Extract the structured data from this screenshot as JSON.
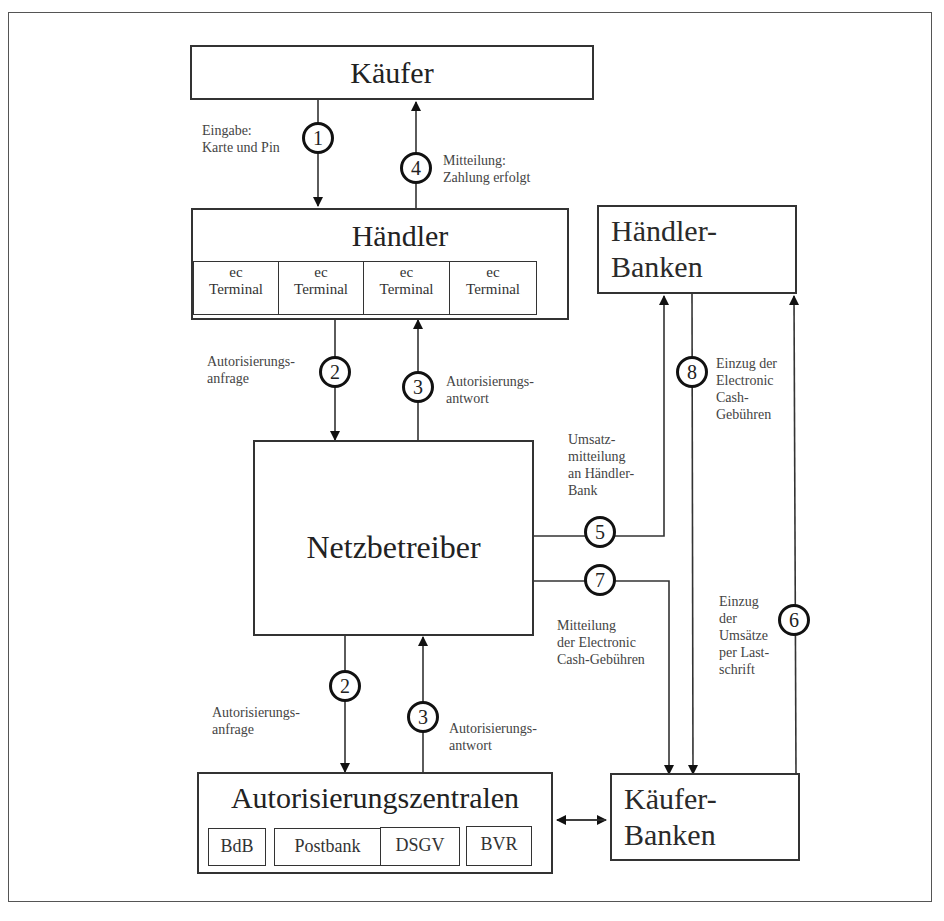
{
  "diagram": {
    "nodes": {
      "kaeufer": {
        "label": "Käufer"
      },
      "haendler": {
        "label": "Händler",
        "terminals": [
          {
            "line1": "ec",
            "line2": "Terminal"
          },
          {
            "line1": "ec",
            "line2": "Terminal"
          },
          {
            "line1": "ec",
            "line2": "Terminal"
          },
          {
            "line1": "ec",
            "line2": "Terminal"
          }
        ]
      },
      "haendler_banken": {
        "line1": "Händler-",
        "line2": "Banken"
      },
      "netzbetreiber": {
        "label": "Netzbetreiber"
      },
      "autorisierungszentralen": {
        "label": "Autorisierungszentralen",
        "members": [
          "BdB",
          "Postbank",
          "DSGV",
          "BVR"
        ]
      },
      "kaeufer_banken": {
        "line1": "Käufer-",
        "line2": "Banken"
      }
    },
    "steps": {
      "s1": {
        "number": "1",
        "label": "Eingabe:\nKarte und Pin"
      },
      "s4": {
        "number": "4",
        "label": "Mitteilung:\nZahlung erfolgt"
      },
      "s2a": {
        "number": "2",
        "label": "Autorisierungs-\nanfrage"
      },
      "s3a": {
        "number": "3",
        "label": "Autorisierungs-\nantwort"
      },
      "s2b": {
        "number": "2",
        "label": "Autorisierungs-\nanfrage"
      },
      "s3b": {
        "number": "3",
        "label": "Autorisierungs-\nantwort"
      },
      "s5": {
        "number": "5",
        "label": "Umsatz-\nmitteilung\nan Händler-\nBank"
      },
      "s7": {
        "number": "7",
        "label": "Mitteilung\nder Electronic\nCash-Gebühren"
      },
      "s8": {
        "number": "8",
        "label": "Einzug der\nElectronic\nCash-\nGebühren"
      },
      "s6": {
        "number": "6",
        "label": "Einzug\nder\nUmsätze\nper Last-\nschrift"
      }
    }
  }
}
